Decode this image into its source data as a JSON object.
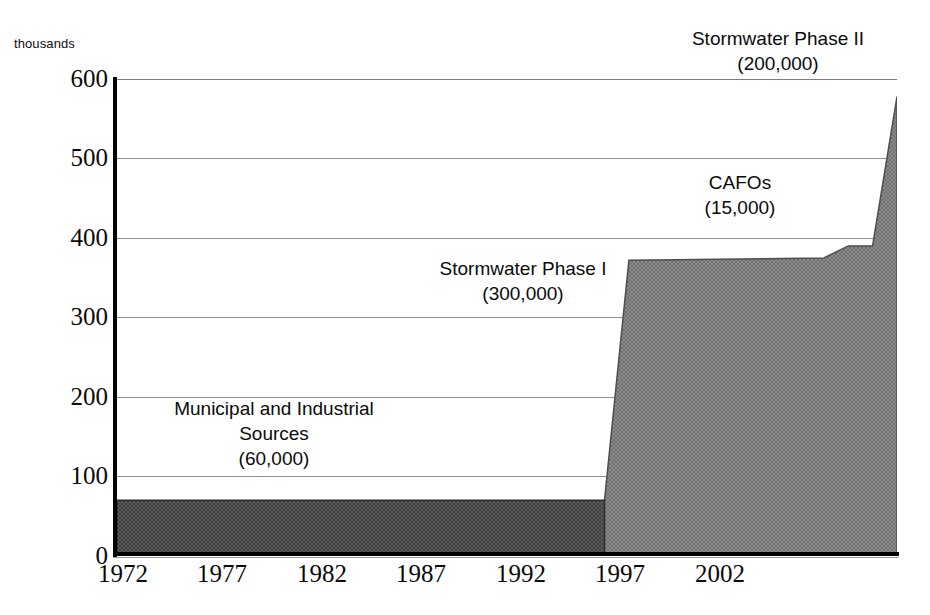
{
  "chart_data": {
    "type": "area",
    "title": "",
    "subtitle": "",
    "xlabel": "",
    "ylabel": "thousands",
    "unit_caption": "thousands",
    "xlim": [
      1972,
      2004
    ],
    "ylim": [
      0,
      600
    ],
    "grid": true,
    "legend": "none",
    "y_ticks": [
      600,
      500,
      400,
      300,
      200,
      100,
      0
    ],
    "x_ticks": [
      1972,
      1977,
      1982,
      1987,
      1992,
      1997,
      2002
    ],
    "series": [
      {
        "name": "Permitted sources (cumulative, thousands)",
        "x": [
          1972,
          1992,
          1993,
          2001,
          2002,
          2003,
          2004
        ],
        "values": [
          70,
          70,
          372,
          375,
          390,
          390,
          578
        ],
        "fill": "#8a8a8a",
        "stroke": "#4a4a4a"
      }
    ],
    "annotations": [
      {
        "id": "municipal",
        "lines": [
          "Municipal and Industrial",
          "Sources",
          "(60,000)"
        ],
        "label": "Municipal and Industrial Sources",
        "value": "60,000"
      },
      {
        "id": "stormwater1",
        "lines": [
          "Stormwater Phase I",
          "(300,000)"
        ],
        "label": "Stormwater Phase I",
        "value": "300,000"
      },
      {
        "id": "cafos",
        "lines": [
          "CAFOs",
          "(15,000)"
        ],
        "label": "CAFOs",
        "value": "15,000"
      },
      {
        "id": "stormwater2",
        "lines": [
          "Stormwater Phase II",
          "(200,000)"
        ],
        "label": "Stormwater Phase II",
        "value": "200,000"
      }
    ],
    "colors": {
      "fill": "#8a8a8a",
      "fill_dark": "#555555",
      "axis": "#000000",
      "grid": "#8e8e8e",
      "text": "#0a0a0a",
      "background": "#ffffff"
    }
  },
  "axis": {
    "unit_caption": "thousands",
    "y_labels": [
      "600",
      "500",
      "400",
      "300",
      "200",
      "100",
      "0"
    ],
    "x_labels": [
      "1972",
      "1977",
      "1982",
      "1987",
      "1992",
      "1997",
      "2002"
    ]
  },
  "annotations": {
    "municipal": {
      "line1": "Municipal and Industrial",
      "line2": "Sources",
      "line3": "(60,000)"
    },
    "stormwater1": {
      "line1": "Stormwater Phase I",
      "line2": "(300,000)"
    },
    "cafos": {
      "line1": "CAFOs",
      "line2": "(15,000)"
    },
    "stormwater2": {
      "line1": "Stormwater Phase II",
      "line2": "(200,000)"
    }
  }
}
